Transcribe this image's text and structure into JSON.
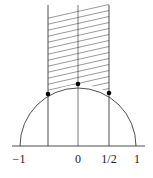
{
  "diagram": {
    "type": "fundamental-domain",
    "axis_labels": [
      {
        "text": "−1",
        "value": -1
      },
      {
        "text": "0",
        "value": 0
      },
      {
        "text": "1/2",
        "value": 0.5
      },
      {
        "text": "1",
        "value": 1
      }
    ],
    "unlabeled_tick_value": -0.5,
    "marked_points": [
      {
        "x": -0.5,
        "label": ""
      },
      {
        "x": 0,
        "label": ""
      },
      {
        "x": 0.5,
        "label": ""
      }
    ],
    "hatched_region": "strip -1/2 <= x <= 1/2 above unit circle",
    "colors": {
      "stroke": "#222222",
      "hatch": "#555555",
      "point": "#000000"
    }
  }
}
